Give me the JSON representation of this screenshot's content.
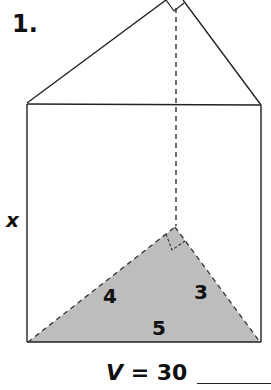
{
  "problem": {
    "number": "1.",
    "height_label": "x",
    "sides": {
      "leg_a": "4",
      "leg_b": "3",
      "hypotenuse": "5"
    },
    "volume_label": "V",
    "volume_eq": " = 30",
    "answer_blank": ""
  },
  "colors": {
    "line": "#222222",
    "shade": "#bdbdbd"
  }
}
